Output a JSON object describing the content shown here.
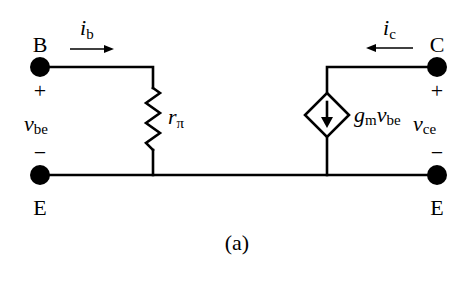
{
  "diagram": {
    "type": "small-signal hybrid-pi equivalent circuit",
    "caption": "(a)",
    "terminals": {
      "base": {
        "label": "B"
      },
      "collector": {
        "label": "C"
      },
      "emitter_left": {
        "label": "E"
      },
      "emitter_right": {
        "label": "E"
      }
    },
    "currents": {
      "ib": {
        "main": "i",
        "sub": "b",
        "direction": "right"
      },
      "ic": {
        "main": "i",
        "sub": "c",
        "direction": "left"
      }
    },
    "voltages": {
      "vbe": {
        "main": "v",
        "sub": "be",
        "plus": "+",
        "minus": "−"
      },
      "vce": {
        "main": "v",
        "sub": "ce",
        "plus": "+",
        "minus": "−"
      }
    },
    "components": {
      "resistor": {
        "main": "r",
        "sub": "π"
      },
      "dependent_source": {
        "g": "g",
        "g_sub": "m",
        "v": "v",
        "v_sub": "be",
        "type": "voltage-controlled current source"
      }
    },
    "colors": {
      "ink": "#000000",
      "background": "#ffffff"
    }
  }
}
